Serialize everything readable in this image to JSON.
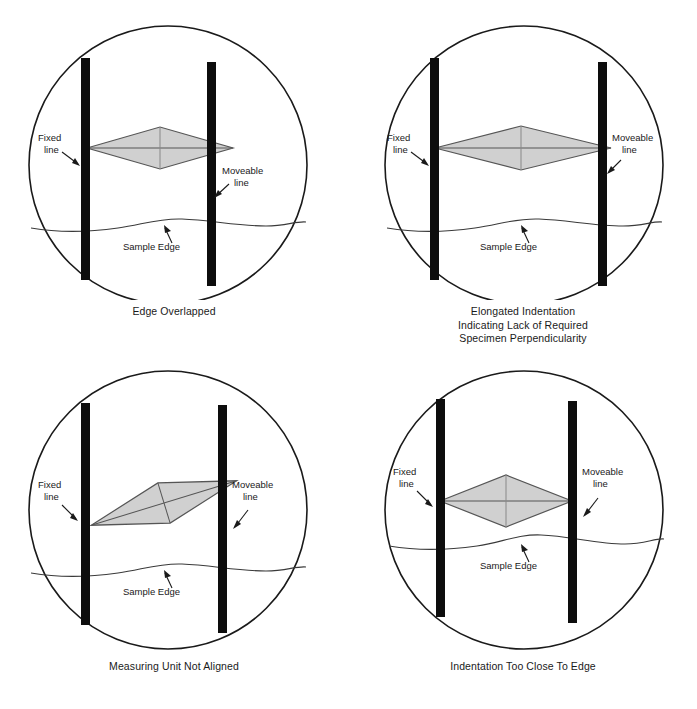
{
  "figure": {
    "background_color": "#ffffff",
    "line_color": "#1a1a1a",
    "bar_color": "#0d0d0d",
    "indent_fill_color": "#d0d0d0",
    "indent_stroke_color": "#555555"
  },
  "shared_labels": {
    "fixed_line": "Fixed\nline",
    "fixed_line_l1": "Fixed",
    "fixed_line_l2": "line",
    "moveable_line_l1": "Moveable",
    "moveable_line_l2": "line",
    "sample_edge": "Sample Edge"
  },
  "panels": [
    {
      "id": "edge-overlapped",
      "position": "top-left",
      "caption": "Edge Overlapped",
      "caption_lines": [
        "Edge Overlapped"
      ],
      "indentation": {
        "shape": "diamond",
        "orientation": "horizontal",
        "half_width": 73,
        "half_height": 21,
        "center_x": 160,
        "center_y": 148,
        "touches_fixed_line": true,
        "touches_moveable_line": true
      },
      "fixed_line_x": 85,
      "moveable_line_x": 211,
      "sample_edge_y": 224
    },
    {
      "id": "elongated-indentation",
      "position": "top-right",
      "caption": "Elongated Indentation Indicating Lack of Required Specimen Perpendicularity",
      "caption_lines": [
        "Elongated Indentation",
        "Indicating Lack of Required",
        "Specimen Perpendicularity"
      ],
      "indentation": {
        "shape": "diamond",
        "orientation": "horizontal-elongated",
        "half_width": 88,
        "half_height": 22,
        "center_x": 166,
        "center_y": 148,
        "apex_offset_x": 6,
        "touches_fixed_line": true,
        "touches_moveable_line": true
      },
      "fixed_line_x": 85,
      "moveable_line_x": 253,
      "sample_edge_y": 224
    },
    {
      "id": "measuring-unit-not-aligned",
      "position": "bottom-left",
      "caption": "Measuring Unit Not Aligned",
      "caption_lines": [
        "Measuring Unit Not Aligned"
      ],
      "indentation": {
        "shape": "diamond",
        "orientation": "rotated",
        "rotation_deg": -17,
        "half_width": 76,
        "half_height": 22,
        "center_x": 164,
        "center_y": 148,
        "touches_fixed_line": true,
        "touches_moveable_line": true
      },
      "fixed_line_x": 85,
      "moveable_line_x": 222,
      "sample_edge_y": 224
    },
    {
      "id": "indentation-too-close-to-edge",
      "position": "bottom-right",
      "caption": "Indentation Too Close To Edge",
      "caption_lines": [
        "Indentation Too Close To Edge"
      ],
      "indentation": {
        "shape": "diamond",
        "orientation": "horizontal",
        "half_width": 66,
        "half_height": 26,
        "center_x": 157,
        "center_y": 146,
        "touches_fixed_line": true,
        "touches_moveable_line": true
      },
      "fixed_line_x": 91,
      "moveable_line_x": 223,
      "sample_edge_y": 206
    }
  ]
}
